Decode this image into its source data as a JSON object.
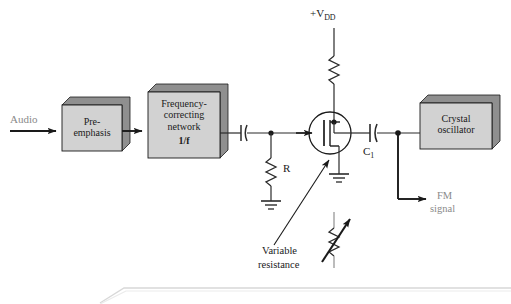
{
  "diagram": {
    "colors": {
      "box_fill": "#d2d2d2",
      "box_shadow": "#8f8f8f",
      "box_stroke": "#1a1a1a",
      "wire": "#2b2b2b",
      "audio_label": "#8a8a8a",
      "fm_label": "#8a8a8a",
      "footer_rule": "#d8d8d8",
      "page_bg": "#ffffff"
    },
    "blocks": [
      {
        "id": "pre-emphasis",
        "label": "Pre-\nemphasis",
        "x": 62,
        "y": 105,
        "w": 60,
        "h": 46
      },
      {
        "id": "frequency-correcting-network",
        "label": "Frequency-\ncorrecting\nnetwork",
        "sub_label": "1/f",
        "x": 148,
        "y": 92,
        "w": 72,
        "h": 66
      },
      {
        "id": "crystal-oscillator",
        "label": "Crystal\noscillator",
        "x": 420,
        "y": 103,
        "w": 72,
        "h": 46
      }
    ],
    "labels": {
      "audio": "Audio",
      "supply_prefix": "+V",
      "supply_subscript": "DD",
      "resistor_r": "R",
      "capacitor_c1_prefix": "C",
      "capacitor_c1_subscript": "1",
      "fm_signal_line1": "FM",
      "fm_signal_line2": "signal",
      "variable_resistance_line1": "Variable",
      "variable_resistance_line2": "resistance",
      "network_ratio": "1/f"
    },
    "components": [
      {
        "name": "resistor-vdd",
        "type": "resistor",
        "orientation": "vertical"
      },
      {
        "name": "resistor-r",
        "type": "resistor",
        "orientation": "vertical"
      },
      {
        "name": "capacitor-coupling-input",
        "type": "capacitor",
        "orientation": "horizontal"
      },
      {
        "name": "capacitor-c1",
        "type": "capacitor",
        "orientation": "horizontal"
      },
      {
        "name": "transistor-fet",
        "type": "fet",
        "orientation": "n-channel"
      },
      {
        "name": "ground-source",
        "type": "ground"
      },
      {
        "name": "ground-resistor-r",
        "type": "ground"
      },
      {
        "name": "variable-resistor-callout",
        "type": "variable-resistor"
      }
    ]
  }
}
